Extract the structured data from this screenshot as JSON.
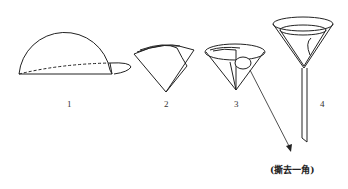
{
  "diagram": {
    "steps": [
      {
        "label": "1",
        "depicts": "semicircle folded filter paper"
      },
      {
        "label": "2",
        "depicts": "folded into quarter cone"
      },
      {
        "label": "3",
        "depicts": "opened cone with one corner"
      },
      {
        "label": "4",
        "depicts": "cone placed in funnel"
      }
    ],
    "annotation": "(撕去一角)",
    "colors": {
      "stroke": "#222222",
      "background": "#ffffff"
    }
  }
}
